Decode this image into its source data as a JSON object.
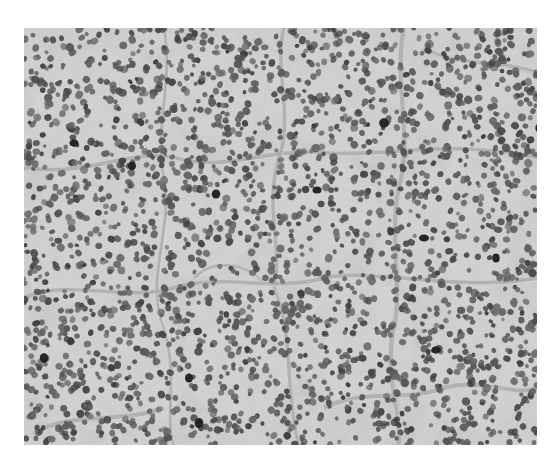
{
  "image": {
    "kind": "grayscale histology micrograph",
    "subject": "nests of round tumor cells with dark nuclei separated by thin fibrovascular septa",
    "frame": {
      "x": 24,
      "y": 28,
      "width": 513,
      "height": 417
    },
    "colors": {
      "page_background": "#ffffff",
      "stroma_background": "#c9c9c9",
      "cytoplasm_light": "#d6d6d6",
      "septa": "#a9a9a9",
      "nucleus": "#4a4a4a",
      "nucleus_dark": "#141414"
    },
    "nests": [
      {
        "cx": 80,
        "cy": 80,
        "rx": 70,
        "ry": 60
      },
      {
        "cx": 200,
        "cy": 60,
        "rx": 70,
        "ry": 50
      },
      {
        "cx": 330,
        "cy": 70,
        "rx": 75,
        "ry": 55
      },
      {
        "cx": 450,
        "cy": 75,
        "rx": 60,
        "ry": 55
      },
      {
        "cx": 60,
        "cy": 210,
        "rx": 55,
        "ry": 70
      },
      {
        "cx": 170,
        "cy": 190,
        "rx": 60,
        "ry": 60
      },
      {
        "cx": 290,
        "cy": 180,
        "rx": 65,
        "ry": 55
      },
      {
        "cx": 420,
        "cy": 200,
        "rx": 70,
        "ry": 60
      },
      {
        "cx": 90,
        "cy": 340,
        "rx": 75,
        "ry": 65
      },
      {
        "cx": 215,
        "cy": 320,
        "rx": 55,
        "ry": 75
      },
      {
        "cx": 330,
        "cy": 310,
        "rx": 60,
        "ry": 65
      },
      {
        "cx": 455,
        "cy": 330,
        "rx": 60,
        "ry": 70
      }
    ],
    "septa_paths": [
      "M0,140 C60,150 110,120 150,130 C200,145 240,120 300,125 C360,130 420,110 513,130",
      "M140,0 C150,50 130,100 140,150 C150,200 120,250 140,300 C155,350 140,390 150,417",
      "M260,0 C250,40 270,90 255,130 C240,180 260,220 250,260",
      "M380,0 C370,60 390,110 375,160 C365,210 380,260 370,300 C360,350 380,390 375,417",
      "M0,270 C50,250 100,275 150,260 C200,245 250,265 300,250 C350,240 430,265 513,250",
      "M250,260 C270,300 260,350 275,417",
      "M170,250 C190,230 220,235 240,255",
      "M20,400 C60,385 100,395 140,380",
      "M400,20 C430,40 470,30 513,45",
      "M300,380 C340,360 380,375 420,360 C460,350 490,370 513,360"
    ]
  }
}
